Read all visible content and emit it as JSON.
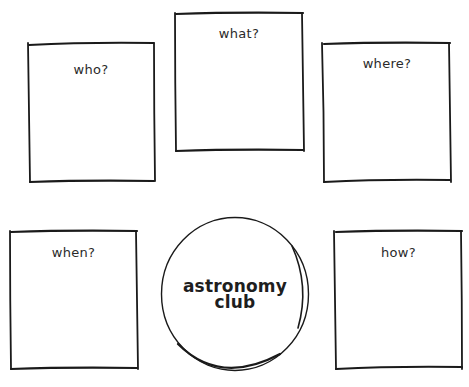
{
  "diagram": {
    "center": {
      "line1": "astronomy",
      "line2": "club"
    },
    "boxes": [
      {
        "id": "who",
        "label": "who?",
        "x": 27,
        "y": 42,
        "w": 128,
        "h": 141
      },
      {
        "id": "what",
        "label": "what?",
        "x": 174,
        "y": 12,
        "w": 130,
        "h": 140
      },
      {
        "id": "where",
        "label": "where?",
        "x": 322,
        "y": 42,
        "w": 130,
        "h": 141
      },
      {
        "id": "when",
        "label": "when?",
        "x": 9,
        "y": 230,
        "w": 129,
        "h": 140
      },
      {
        "id": "how",
        "label": "how?",
        "x": 334,
        "y": 230,
        "w": 129,
        "h": 140
      }
    ],
    "stroke_color": "#1a1a1a",
    "background_color": "#ffffff"
  }
}
